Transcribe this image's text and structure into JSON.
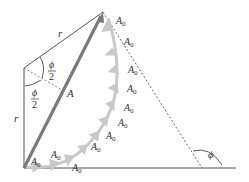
{
  "diagram": {
    "labels": {
      "radius_top": "r",
      "radius_left": "r",
      "half_angle_top": "ϕ",
      "half_angle_top_den": "2",
      "half_angle_bottom": "ϕ",
      "half_angle_bottom_den": "2",
      "resultant": "A",
      "angle": "ϕ",
      "phasor_base": "A",
      "phasor_sub": "0"
    },
    "phasor_count": 11,
    "colors": {
      "resultant": "#7a7a7a",
      "phasor_arc": "#c8c8c8",
      "lines": "#555555",
      "text": "#333333"
    }
  }
}
